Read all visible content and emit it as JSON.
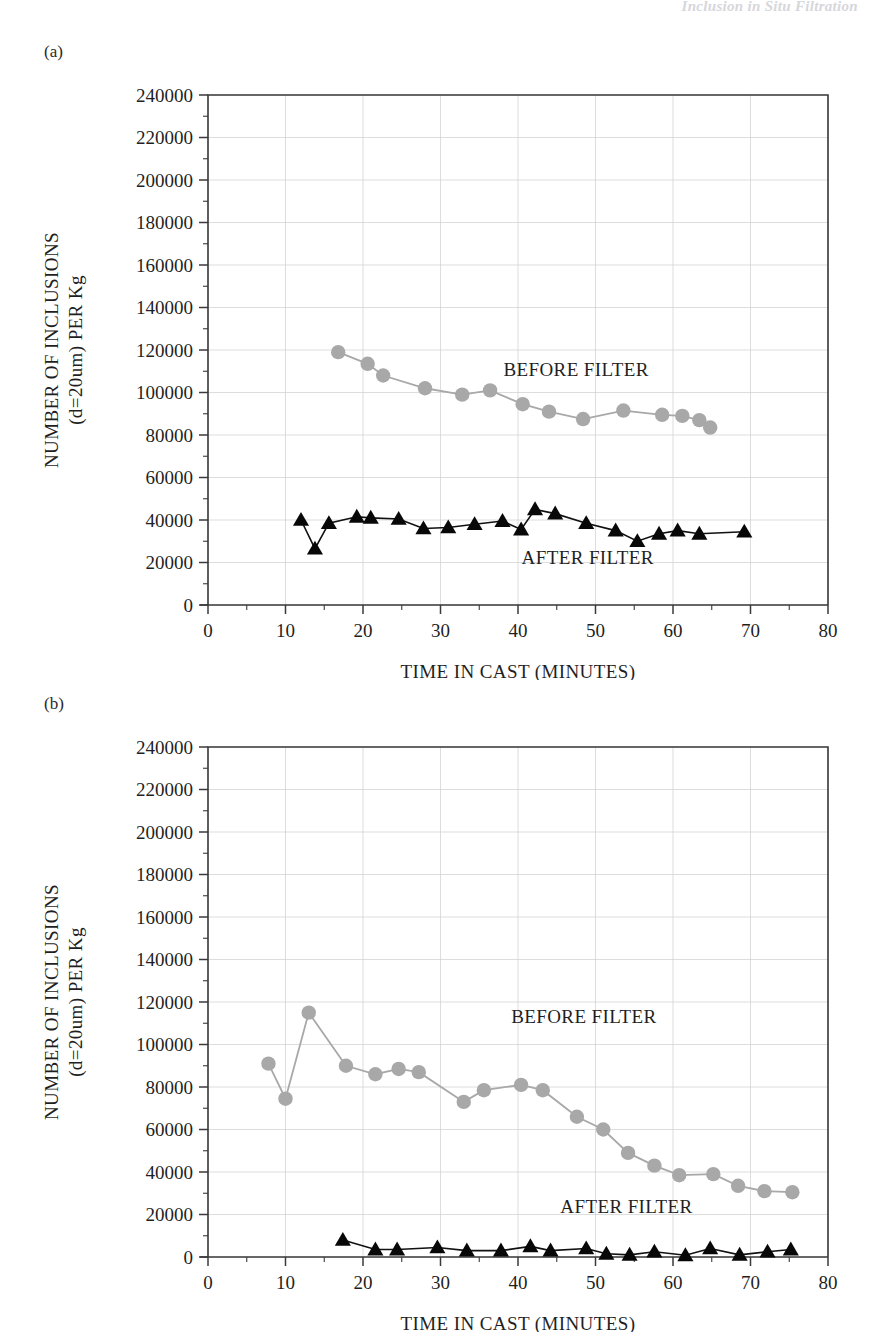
{
  "running_head": "Inclusion in Situ Filtration",
  "panels": [
    {
      "id": "a",
      "label": "(a)"
    },
    {
      "id": "b",
      "label": "(b)"
    }
  ],
  "axes": {
    "y_title_line1": "NUMBER OF INCLUSIONS",
    "y_title_line2": "(d=20um) PER Kg",
    "x_title": "TIME IN CAST (MINUTES)",
    "y_ticks": [
      "0",
      "20000",
      "40000",
      "60000",
      "80000",
      "100000",
      "120000",
      "140000",
      "160000",
      "180000",
      "200000",
      "220000",
      "240000"
    ],
    "x_ticks": [
      "0",
      "10",
      "20",
      "30",
      "40",
      "50",
      "60",
      "70",
      "80"
    ]
  },
  "colors": {
    "before_filter": "#a8a8a8",
    "after_filter": "#080808",
    "axis": "#3a3a3a",
    "grid": "#cfcfcf",
    "running_head": "#c9c9cf"
  },
  "series_labels": {
    "before": "BEFORE FILTER",
    "after": "AFTER FILTER"
  },
  "chart_data": [
    {
      "type": "line",
      "panel": "(a)",
      "title": "",
      "xlabel": "TIME IN CAST (MINUTES)",
      "ylabel": "NUMBER OF INCLUSIONS (d=20um) PER Kg",
      "xlim": [
        0,
        80
      ],
      "ylim": [
        0,
        240000
      ],
      "xtick_step": 10,
      "ytick_step": 20000,
      "xminor_step": 5,
      "yminor_step": 10000,
      "grid": true,
      "legend": "annotations",
      "annotations": [
        {
          "text": "BEFORE FILTER",
          "x": 47.5,
          "y": 108000
        },
        {
          "text": "AFTER FILTER",
          "x": 49.0,
          "y": 19500
        }
      ],
      "series": [
        {
          "name": "BEFORE FILTER",
          "marker": "circle",
          "color": "#a8a8a8",
          "x": [
            16.8,
            20.6,
            22.6,
            28.0,
            32.8,
            36.4,
            40.6,
            44.0,
            48.4,
            53.6,
            58.6,
            61.2,
            63.4,
            64.8
          ],
          "y": [
            119000,
            113500,
            108000,
            102000,
            99000,
            101000,
            94500,
            91000,
            87500,
            91500,
            89500,
            89000,
            87000,
            83500
          ]
        },
        {
          "name": "AFTER FILTER",
          "marker": "triangle",
          "color": "#080808",
          "x": [
            12.0,
            13.8,
            15.6,
            19.2,
            21.0,
            24.6,
            27.8,
            31.0,
            34.4,
            38.0,
            40.4,
            42.2,
            44.8,
            48.8,
            52.6,
            55.4,
            58.2,
            60.6,
            63.4,
            69.2
          ],
          "y": [
            40000,
            26500,
            38500,
            41500,
            41000,
            40500,
            36000,
            36500,
            38000,
            39500,
            35500,
            45000,
            43000,
            38500,
            35000,
            30000,
            33500,
            35000,
            33500,
            34500
          ]
        }
      ]
    },
    {
      "type": "line",
      "panel": "(b)",
      "title": "",
      "xlabel": "TIME IN CAST (MINUTES)",
      "ylabel": "NUMBER OF INCLUSIONS (d=20um) PER Kg",
      "xlim": [
        0,
        80
      ],
      "ylim": [
        0,
        240000
      ],
      "xtick_step": 10,
      "ytick_step": 20000,
      "xminor_step": 5,
      "yminor_step": 10000,
      "grid": true,
      "legend": "annotations",
      "annotations": [
        {
          "text": "BEFORE FILTER",
          "x": 48.5,
          "y": 110000
        },
        {
          "text": "AFTER FILTER",
          "x": 54.0,
          "y": 20500
        }
      ],
      "series": [
        {
          "name": "BEFORE FILTER",
          "marker": "circle",
          "color": "#a8a8a8",
          "x": [
            7.8,
            10.0,
            13.0,
            17.8,
            21.6,
            24.6,
            27.2,
            33.0,
            35.6,
            40.4,
            43.2,
            47.6,
            51.0,
            54.2,
            57.6,
            60.8,
            65.2,
            68.4,
            71.8,
            75.4
          ],
          "y": [
            91000,
            74500,
            115000,
            90000,
            86000,
            88500,
            87000,
            73000,
            78500,
            81000,
            78500,
            66000,
            60000,
            49000,
            43000,
            38500,
            39000,
            33500,
            31000,
            30500
          ]
        },
        {
          "name": "AFTER FILTER",
          "marker": "triangle",
          "color": "#080808",
          "x": [
            17.4,
            21.6,
            24.4,
            29.6,
            33.4,
            37.8,
            41.6,
            44.2,
            48.8,
            51.4,
            54.4,
            57.6,
            61.6,
            64.8,
            68.6,
            72.2,
            75.2
          ],
          "y": [
            8000,
            3500,
            3500,
            4500,
            3000,
            3000,
            5000,
            3000,
            4000,
            1500,
            1000,
            2500,
            800,
            4000,
            1000,
            2500,
            3500
          ]
        }
      ]
    }
  ]
}
